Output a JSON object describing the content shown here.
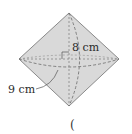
{
  "diagram": {
    "shape": "double-cone",
    "colors": {
      "fill": "#d9d9d9",
      "stroke": "#8a8a8a",
      "dashed": "#6a6a6a"
    },
    "labels": {
      "height": "8 cm",
      "radius": "9 cm"
    },
    "bottom_mark": "("
  }
}
